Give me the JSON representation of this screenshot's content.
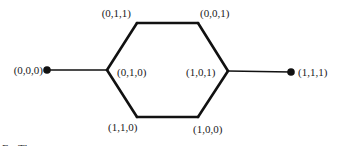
{
  "diagram": {
    "type": "graph",
    "nodes": [
      {
        "id": "n000",
        "label": "(0,0,0)",
        "style": "dot"
      },
      {
        "id": "n010",
        "label": "(0,1,0)",
        "style": "vertex"
      },
      {
        "id": "n011",
        "label": "(0,1,1)",
        "style": "vertex"
      },
      {
        "id": "n001",
        "label": "(0,0,1)",
        "style": "vertex"
      },
      {
        "id": "n101",
        "label": "(1,0,1)",
        "style": "vertex"
      },
      {
        "id": "n100",
        "label": "(1,0,0)",
        "style": "vertex"
      },
      {
        "id": "n110",
        "label": "(1,1,0)",
        "style": "vertex"
      },
      {
        "id": "n111",
        "label": "(1,1,1)",
        "style": "dot"
      }
    ],
    "edges": [
      {
        "from": "n000",
        "to": "n010",
        "weight": "thin"
      },
      {
        "from": "n010",
        "to": "n011",
        "weight": "thick"
      },
      {
        "from": "n011",
        "to": "n001",
        "weight": "thick"
      },
      {
        "from": "n001",
        "to": "n101",
        "weight": "thick"
      },
      {
        "from": "n101",
        "to": "n100",
        "weight": "thick"
      },
      {
        "from": "n100",
        "to": "n110",
        "weight": "thick"
      },
      {
        "from": "n110",
        "to": "n010",
        "weight": "thick"
      },
      {
        "from": "n101",
        "to": "n111",
        "weight": "thin"
      }
    ],
    "caption_fragment": "F... Th..."
  }
}
